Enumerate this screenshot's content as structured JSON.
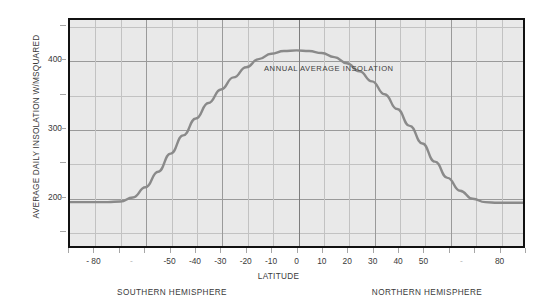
{
  "chart_data": {
    "type": "line",
    "title": "",
    "xlabel": "LATITUDE",
    "ylabel": "AVERAGE DAILY INSOLATION W/MSQUARED",
    "xlim": [
      -90,
      90
    ],
    "ylim": [
      125,
      460
    ],
    "grid": true,
    "legend_position": "none",
    "annotations": [
      {
        "text": "ANNUAL AVERAGE INSOLATION",
        "x": 24,
        "y": 407
      }
    ],
    "region_labels": [
      {
        "text": "SOUTHERN HEMISPHERE",
        "side": "left"
      },
      {
        "text": "NORTHERN HEMISPHERE",
        "side": "right"
      }
    ],
    "x_major_ticks": [
      -90,
      -80,
      -70,
      -60,
      -50,
      -40,
      -30,
      -20,
      -10,
      0,
      10,
      20,
      30,
      40,
      50,
      60,
      70,
      80,
      90
    ],
    "x_tick_labels": [
      {
        "value": -80,
        "label": "- 80",
        "faint": false
      },
      {
        "value": -65,
        "label": "-",
        "faint": true
      },
      {
        "value": -50,
        "label": "-50",
        "faint": false
      },
      {
        "value": -40,
        "label": "-40",
        "faint": false
      },
      {
        "value": -30,
        "label": "-30",
        "faint": false
      },
      {
        "value": -20,
        "label": "-20",
        "faint": false
      },
      {
        "value": -10,
        "label": "-10",
        "faint": false
      },
      {
        "value": 0,
        "label": "0",
        "faint": false
      },
      {
        "value": 10,
        "label": "10",
        "faint": false
      },
      {
        "value": 20,
        "label": "20",
        "faint": false
      },
      {
        "value": 30,
        "label": "30",
        "faint": false
      },
      {
        "value": 40,
        "label": "40",
        "faint": false
      },
      {
        "value": 50,
        "label": "50",
        "faint": false
      },
      {
        "value": 65,
        "label": "-",
        "faint": true
      },
      {
        "value": 80,
        "label": "80",
        "faint": false
      }
    ],
    "y_major_ticks": [
      200,
      300,
      400
    ],
    "y_minor_ticks": [
      150,
      250,
      350,
      450
    ],
    "y_tick_labels": [
      "200",
      "300",
      "400"
    ],
    "series": [
      {
        "name": "ANNUAL AVERAGE INSOLATION",
        "color": "#8a8a8a",
        "x": [
          -90,
          -85,
          -80,
          -75,
          -70,
          -65,
          -60,
          -55,
          -50,
          -45,
          -40,
          -35,
          -30,
          -25,
          -20,
          -15,
          -10,
          -5,
          0,
          5,
          10,
          15,
          20,
          25,
          30,
          35,
          40,
          45,
          50,
          55,
          60,
          65,
          70,
          75,
          80,
          85,
          90
        ],
        "values": [
          190,
          190,
          190,
          190,
          191,
          197,
          212,
          235,
          262,
          289,
          314,
          337,
          357,
          375,
          390,
          402,
          410,
          414,
          415,
          414,
          411,
          405,
          396,
          384,
          369,
          350,
          328,
          303,
          277,
          250,
          226,
          207,
          195,
          190,
          189,
          189,
          189
        ]
      }
    ]
  },
  "plot_geometry": {
    "left": 68,
    "top": 18,
    "width": 457,
    "height": 230
  },
  "colors": {
    "plot_background": "#e9e9e9",
    "frame": "#111111",
    "gridline_minor": "#c2c2c2",
    "gridline_major": "#9a9a9a",
    "series": "#8a8a8a",
    "text": "#3a3a3a",
    "page_background": "#ffffff"
  }
}
